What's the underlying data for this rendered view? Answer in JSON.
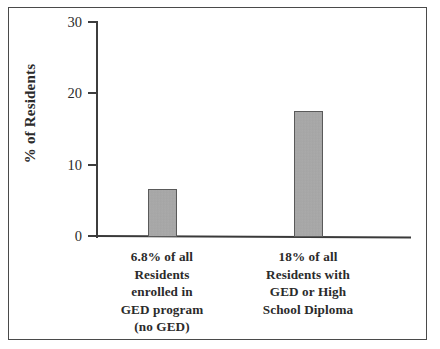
{
  "chart_data": {
    "type": "bar",
    "title": "",
    "subtitle": "",
    "xlabel": "",
    "ylabel": "% of Residents",
    "ylim": [
      0,
      30
    ],
    "yticks": [
      0,
      10,
      20,
      30
    ],
    "ytick_labels": [
      "0",
      "10",
      "20",
      "30"
    ],
    "grid": false,
    "legend": null,
    "categories": [
      "6.8% of all Residents enrolled in GED program (no GED)",
      "18% of all Residents with GED or High School Diploma"
    ],
    "category_lines": [
      [
        "6.8% of all",
        "Residents",
        "enrolled in",
        "GED program",
        "(no GED)"
      ],
      [
        "18% of all",
        "Residents with",
        "GED or High",
        "School Diploma"
      ]
    ],
    "values": [
      6.8,
      17.7
    ],
    "value_labels": [
      "6.8%",
      "18%"
    ],
    "bar_color": "#a6a6a6",
    "bar_edge_color": "#5a5a5a",
    "axis_color": "#3d3d3d",
    "text_color": "#2b2b2b",
    "background_color": "#ffffff",
    "frame_color": "#4a4a4a"
  }
}
